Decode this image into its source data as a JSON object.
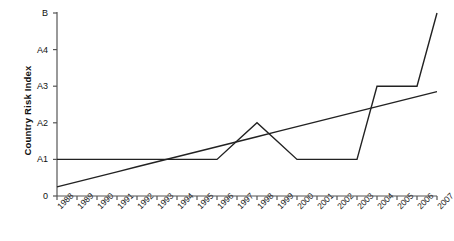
{
  "chart_data": {
    "type": "line",
    "title": "",
    "xlabel": "",
    "ylabel": "Country Risk Index",
    "categories": [
      "1988",
      "1989",
      "1990",
      "1991",
      "1992",
      "1993",
      "1994",
      "1995",
      "1996",
      "1997",
      "1998",
      "1999",
      "2000",
      "2001",
      "2002",
      "2003",
      "2004",
      "2005",
      "2006",
      "2007"
    ],
    "ytick_labels": [
      "0",
      "A1",
      "A2",
      "A3",
      "A4",
      "B"
    ],
    "ytick_values": [
      0,
      1,
      2,
      3,
      4,
      5
    ],
    "ylim": [
      0,
      5
    ],
    "grid": false,
    "legend": "none",
    "series": [
      {
        "name": "Country Risk Index",
        "type": "line",
        "values": [
          1,
          1,
          1,
          1,
          1,
          1,
          1,
          1,
          1,
          1.5,
          2,
          1.5,
          1,
          1,
          1,
          1,
          3,
          3,
          3,
          5
        ]
      },
      {
        "name": "Linear trend",
        "type": "line",
        "values": [
          0.25,
          0.387,
          0.524,
          0.661,
          0.798,
          0.935,
          1.072,
          1.209,
          1.346,
          1.483,
          1.62,
          1.757,
          1.894,
          2.031,
          2.168,
          2.305,
          2.442,
          2.579,
          2.716,
          2.853
        ]
      }
    ]
  },
  "colors": {
    "axis": "#555555",
    "line": "#222222",
    "text": "#111111",
    "background": "#ffffff"
  }
}
